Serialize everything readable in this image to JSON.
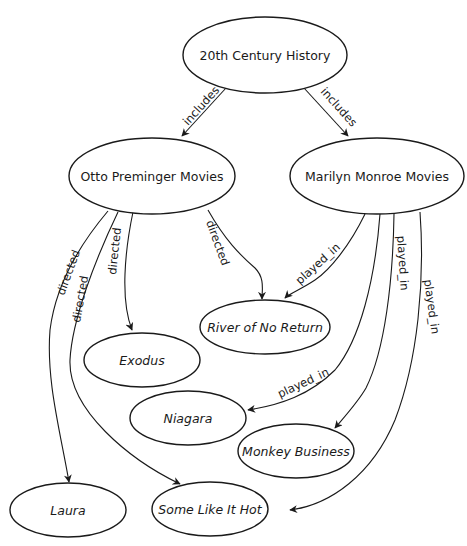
{
  "diagram": {
    "type": "directed-graph",
    "nodes": {
      "root": "20th Century History",
      "preminger": "Otto Preminger Movies",
      "monroe": "Marilyn Monroe Movies",
      "river": "River of No Return",
      "exodus": "Exodus",
      "niagara": "Niagara",
      "monkey": "Monkey Business",
      "laura": "Laura",
      "hot": "Some Like It Hot"
    },
    "edge_labels": {
      "includes_left": "includes",
      "includes_right": "includes",
      "directed_laura": "directed",
      "directed_hot": "directed",
      "directed_exodus": "directed",
      "directed_river": "directed",
      "played_river": "played_in",
      "played_niagara": "played_in",
      "played_monkey": "played_in",
      "played_hot": "played_in"
    },
    "edges": [
      {
        "from": "20th Century History",
        "to": "Otto Preminger Movies",
        "label": "includes"
      },
      {
        "from": "20th Century History",
        "to": "Marilyn Monroe Movies",
        "label": "includes"
      },
      {
        "from": "Otto Preminger Movies",
        "to": "Laura",
        "label": "directed"
      },
      {
        "from": "Otto Preminger Movies",
        "to": "Some Like It Hot",
        "label": "directed"
      },
      {
        "from": "Otto Preminger Movies",
        "to": "Exodus",
        "label": "directed"
      },
      {
        "from": "Otto Preminger Movies",
        "to": "River of No Return",
        "label": "directed"
      },
      {
        "from": "Marilyn Monroe Movies",
        "to": "River of No Return",
        "label": "played_in"
      },
      {
        "from": "Marilyn Monroe Movies",
        "to": "Niagara",
        "label": "played_in"
      },
      {
        "from": "Marilyn Monroe Movies",
        "to": "Monkey Business",
        "label": "played_in"
      },
      {
        "from": "Marilyn Monroe Movies",
        "to": "Some Like It Hot",
        "label": "played_in"
      }
    ]
  }
}
